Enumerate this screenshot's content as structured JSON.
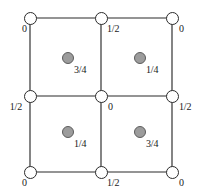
{
  "figure": {
    "name": "space-group-symmetry-diagram",
    "type": "crystallographic unit cell projection",
    "width": 201,
    "height": 195,
    "background_color": "#ffffff",
    "line_color": "#2b2b2b",
    "node_fill_color": "#ffffff",
    "node_stroke_color": "#2b2b2b",
    "dot_fill_color": "#9c9c9c",
    "dot_stroke_color": "#5c5c5c",
    "text_color": "#1a1a1a"
  },
  "grid": {
    "x_positions": [
      30,
      101,
      172
    ],
    "y_positions": [
      18,
      96,
      172
    ],
    "horizontal_lines": 3,
    "vertical_lines": 3
  },
  "nodes": [
    {
      "id": "node-top-left",
      "name": "open-circle-node",
      "x": 30,
      "y": 18,
      "label": "0",
      "label_x": 22,
      "label_y": 29,
      "align": "right",
      "glyph": "open-circle"
    },
    {
      "id": "node-top-center",
      "name": "open-circle-node",
      "x": 101,
      "y": 18,
      "label": "1/2",
      "label_x": 107,
      "label_y": 29,
      "align": "right",
      "glyph": "open-circle"
    },
    {
      "id": "node-top-right",
      "name": "open-circle-node",
      "x": 172,
      "y": 18,
      "label": "0",
      "label_x": 179,
      "label_y": 29,
      "align": "right",
      "glyph": "open-circle"
    },
    {
      "id": "node-mid-left",
      "name": "open-circle-node",
      "x": 30,
      "y": 96,
      "label": "1/2",
      "label_x": 22,
      "label_y": 107,
      "align": "left",
      "glyph": "open-circle"
    },
    {
      "id": "node-mid-center",
      "name": "open-circle-node",
      "x": 101,
      "y": 96,
      "label": "0",
      "label_x": 108,
      "label_y": 107,
      "align": "right",
      "glyph": "open-circle"
    },
    {
      "id": "node-mid-right",
      "name": "open-circle-node",
      "x": 172,
      "y": 96,
      "label": "1/2",
      "label_x": 179,
      "label_y": 107,
      "align": "right",
      "glyph": "open-circle"
    },
    {
      "id": "node-bottom-left",
      "name": "open-circle-node",
      "x": 30,
      "y": 172,
      "label": "0",
      "label_x": 22,
      "label_y": 183,
      "align": "right",
      "glyph": "open-circle"
    },
    {
      "id": "node-bottom-center",
      "name": "open-circle-node",
      "x": 101,
      "y": 172,
      "label": "1/2",
      "label_x": 107,
      "label_y": 183,
      "align": "right",
      "glyph": "open-circle"
    },
    {
      "id": "node-bottom-right",
      "name": "open-circle-node",
      "x": 172,
      "y": 172,
      "label": "0",
      "label_x": 179,
      "label_y": 183,
      "align": "right",
      "glyph": "open-circle"
    }
  ],
  "dots": [
    {
      "id": "dot-upper-left",
      "name": "filled-gray-dot",
      "x": 68,
      "y": 58,
      "label": "3/4",
      "label_x": 74,
      "label_y": 70
    },
    {
      "id": "dot-upper-right",
      "name": "filled-gray-dot",
      "x": 140,
      "y": 58,
      "label": "1/4",
      "label_x": 146,
      "label_y": 70
    },
    {
      "id": "dot-lower-left",
      "name": "filled-gray-dot",
      "x": 68,
      "y": 132,
      "label": "1/4",
      "label_x": 74,
      "label_y": 144
    },
    {
      "id": "dot-lower-right",
      "name": "filled-gray-dot",
      "x": 140,
      "y": 132,
      "label": "3/4",
      "label_x": 146,
      "label_y": 144
    }
  ]
}
